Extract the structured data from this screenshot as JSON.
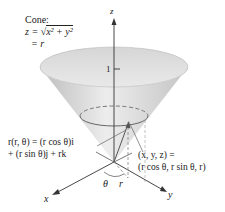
{
  "figure": {
    "cone_label": {
      "title": "Cone:",
      "eq_lhs": "z = ",
      "sqrt_content": "x² + y²",
      "line3": "= r"
    },
    "axes": {
      "z": "z",
      "x": "x",
      "y": "y"
    },
    "tick_label": "1",
    "vector_label": {
      "line1": "r(r, θ) = (r cos θ)i",
      "line2": "+ (r sin θ)j + rk"
    },
    "point_label": {
      "line1": "(x, y, z) =",
      "line2": "(r cos θ, r sin θ, r)"
    },
    "angle_label": "θ",
    "radius_label": "r",
    "colors": {
      "cone_fill_outer": "#cfcfcf",
      "cone_fill_inner": "#ececec",
      "axis": "#333333",
      "dashed": "#888888",
      "leader": "#666666"
    }
  }
}
